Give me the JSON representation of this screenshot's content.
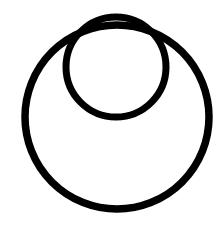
{
  "diagram": {
    "type": "nested-circles",
    "stroke_color": "#000000",
    "background": "#ffffff",
    "shapes": [
      {
        "name": "outer-circle",
        "cx": 117,
        "cy": 117,
        "r": 92,
        "stroke_width": 7.5
      },
      {
        "name": "inner-circle",
        "cx": 116,
        "cy": 67,
        "r": 50,
        "stroke_width": 7
      }
    ]
  }
}
